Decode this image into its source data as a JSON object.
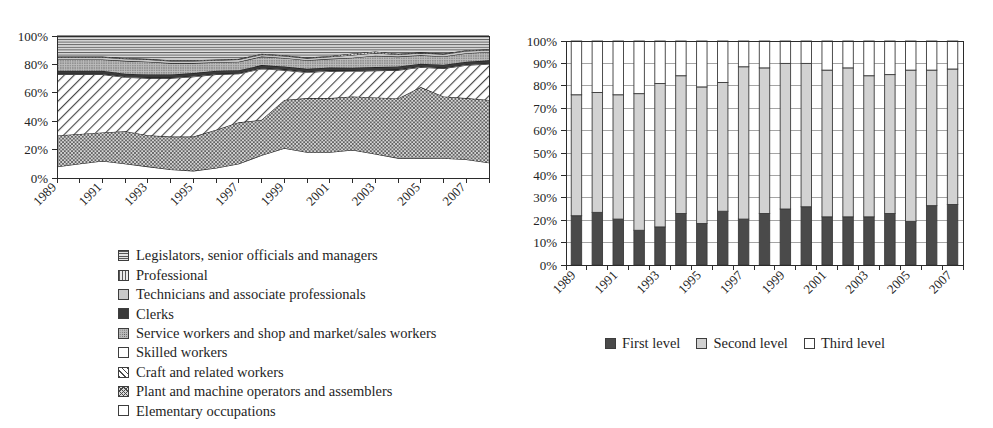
{
  "chart_data": [
    {
      "id": "occupation-structure-area",
      "type": "area",
      "stacked": true,
      "normalized_percent": true,
      "title": "",
      "xlabel": "",
      "ylabel": "",
      "ylim": [
        0,
        100
      ],
      "ytick_labels": [
        "0%",
        "20%",
        "40%",
        "60%",
        "80%",
        "100%"
      ],
      "ytick_values": [
        0,
        20,
        40,
        60,
        80,
        100
      ],
      "grid": false,
      "legend_position": "below",
      "x": [
        1989,
        1990,
        1991,
        1992,
        1993,
        1994,
        1995,
        1996,
        1997,
        1998,
        1999,
        2000,
        2001,
        2002,
        2003,
        2004,
        2005,
        2006,
        2007,
        2008
      ],
      "xtick_labels": [
        "1989",
        "1991",
        "1993",
        "1995",
        "1997",
        "1999",
        "2001",
        "2003",
        "2005",
        "2007"
      ],
      "xtick_values": [
        1989,
        1991,
        1993,
        1995,
        1997,
        1999,
        2001,
        2003,
        2005,
        2007
      ],
      "stack_order_bottom_to_top": [
        "Elementary occupations",
        "Plant and machine operators and assemblers",
        "Craft and related workers",
        "Skilled workers",
        "Service workers and shop and market/sales workers",
        "Clerks",
        "Technicians and associate professionals",
        "Professional",
        "Legislators, senior officials and managers"
      ],
      "series": [
        {
          "name": "Elementary occupations",
          "pattern": "white",
          "values": [
            8,
            10,
            12,
            10,
            8,
            6,
            5,
            7,
            10,
            16,
            21,
            18,
            18,
            20,
            17,
            14,
            14,
            14,
            13,
            11
          ]
        },
        {
          "name": "Plant and machine operators and assemblers",
          "pattern": "cross-hatch",
          "values": [
            22,
            21,
            20,
            23,
            22,
            23,
            24,
            27,
            29,
            25,
            34,
            38,
            38,
            38,
            40,
            42,
            50,
            44,
            43,
            45
          ]
        },
        {
          "name": "Craft and related workers",
          "pattern": "diagonal-hatch",
          "values": [
            43,
            42,
            41,
            38,
            40,
            41,
            42,
            39,
            34,
            36,
            21,
            18,
            19,
            18,
            19,
            20,
            14,
            20,
            23,
            26
          ]
        },
        {
          "name": "Skilled workers",
          "pattern": "white",
          "values": [
            0.5,
            0.5,
            0.5,
            0.5,
            0.5,
            0.5,
            0.5,
            0.5,
            0.5,
            0.5,
            0.5,
            0.5,
            0.5,
            0.5,
            0.5,
            0.5,
            0.5,
            0.5,
            0.5,
            0.5
          ]
        },
        {
          "name": "Clerks",
          "pattern": "dark",
          "values": [
            2,
            2,
            2,
            2,
            2,
            2,
            2,
            2,
            2,
            2,
            2,
            2,
            2,
            2,
            2,
            2,
            2,
            2,
            2,
            2
          ]
        },
        {
          "name": "Service workers and shop and market/sales workers",
          "pattern": "gray-dots",
          "values": [
            8,
            8,
            8,
            9,
            9,
            8,
            7,
            6,
            6,
            6,
            6,
            6,
            6,
            7,
            8,
            7,
            6,
            6,
            6,
            6
          ]
        },
        {
          "name": "Technicians and associate professionals",
          "pattern": "solid-light",
          "values": [
            1.5,
            1.5,
            1.5,
            1.5,
            1.5,
            1.5,
            1.5,
            1.5,
            1.5,
            1.5,
            1.5,
            1.5,
            1.5,
            2,
            2,
            1.5,
            1.5,
            1.5,
            1.5,
            1.5
          ]
        },
        {
          "name": "Professional",
          "pattern": "vertical-lines",
          "values": [
            0.5,
            0.5,
            0.5,
            0.5,
            0.5,
            0.5,
            0.5,
            0.5,
            0.5,
            0.5,
            0.5,
            0.5,
            0.5,
            1,
            1,
            0.5,
            0.5,
            0.5,
            0.5,
            0.5
          ]
        },
        {
          "name": "Legislators, senior officials and managers",
          "pattern": "horizontal-lines",
          "values": [
            14.5,
            14.5,
            14.5,
            15.5,
            16,
            17,
            17,
            16.5,
            16,
            12.5,
            13.5,
            15,
            14,
            12.5,
            11,
            12.5,
            11.5,
            12.5,
            10,
            9.5
          ]
        }
      ]
    },
    {
      "id": "education-level-bars",
      "type": "bar",
      "stacked": true,
      "normalized_percent": true,
      "title": "",
      "xlabel": "",
      "ylabel": "",
      "ylim": [
        0,
        100
      ],
      "ytick_labels": [
        "0%",
        "10%",
        "20%",
        "30%",
        "40%",
        "50%",
        "60%",
        "70%",
        "80%",
        "90%",
        "100%"
      ],
      "ytick_values": [
        0,
        10,
        20,
        30,
        40,
        50,
        60,
        70,
        80,
        90,
        100
      ],
      "grid": true,
      "legend_position": "below",
      "categories": [
        1989,
        1990,
        1991,
        1992,
        1993,
        1994,
        1995,
        1996,
        1997,
        1998,
        1999,
        2000,
        2001,
        2002,
        2003,
        2004,
        2005,
        2006,
        2007
      ],
      "xtick_labels": [
        "1989",
        "1991",
        "1993",
        "1995",
        "1997",
        "1999",
        "2001",
        "2003",
        "2005",
        "2007"
      ],
      "xtick_values": [
        1989,
        1991,
        1993,
        1995,
        1997,
        1999,
        2001,
        2003,
        2005,
        2007
      ],
      "series": [
        {
          "name": "First level",
          "swatch": "first-level",
          "values": [
            22,
            23.5,
            20.5,
            15.5,
            17,
            23,
            18.5,
            24,
            20.5,
            23,
            25,
            26,
            21.5,
            21.5,
            21.5,
            23,
            19.5,
            26.5,
            27
          ]
        },
        {
          "name": "Second level",
          "swatch": "second-level",
          "values": [
            54,
            53.5,
            55.5,
            61,
            64,
            61.5,
            61,
            57.5,
            68,
            65,
            65,
            64,
            65.5,
            66.5,
            63,
            62,
            67.5,
            60.5,
            60.5
          ]
        },
        {
          "name": "Third level",
          "swatch": "third-level",
          "values": [
            24,
            23,
            24,
            23.5,
            19,
            15.5,
            20.5,
            18.5,
            11.5,
            12,
            10,
            10,
            13,
            12,
            15.5,
            15,
            13,
            13,
            12.5
          ]
        }
      ]
    }
  ],
  "left_chart": {
    "legend": {
      "items": [
        {
          "label": "Legislators, senior officials and managers",
          "swatch": "sw-hlines"
        },
        {
          "label": "Professional",
          "swatch": "sw-vlines"
        },
        {
          "label": "Technicians and associate professionals",
          "swatch": "sw-solidlight"
        },
        {
          "label": "Clerks",
          "swatch": "sw-dark"
        },
        {
          "label": "Service workers and shop and market/sales workers",
          "swatch": "sw-dots"
        },
        {
          "label": "Skilled workers",
          "swatch": "sw-white"
        },
        {
          "label": "Craft and related workers",
          "swatch": "sw-diag"
        },
        {
          "label": "Plant and machine operators and assemblers",
          "swatch": "sw-cross"
        },
        {
          "label": "Elementary occupations",
          "swatch": "sw-white"
        }
      ]
    }
  },
  "right_chart": {
    "legend": {
      "items": [
        {
          "label": "First level",
          "swatch": "sw-firstlevel"
        },
        {
          "label": "Second level",
          "swatch": "sw-secondlevel"
        },
        {
          "label": "Third level",
          "swatch": "sw-thirdlevel"
        }
      ]
    }
  }
}
